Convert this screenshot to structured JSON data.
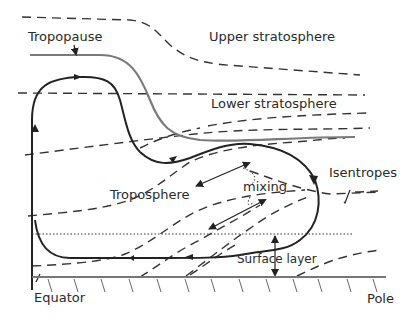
{
  "diagram": {
    "labels": {
      "tropopause": "Tropopause",
      "upper_stratosphere": "Upper stratosphere",
      "lower_stratosphere": "Lower stratosphere",
      "troposphere": "Troposphere",
      "mixing": "mixing",
      "isentropes": "Isentropes",
      "surface_layer": "Surface layer",
      "equator": "Equator",
      "pole": "Pole"
    },
    "colors": {
      "circulation": "#222222",
      "tropopause": "#7a7a7a",
      "isentropes": "#333333",
      "ground": "#777777"
    }
  }
}
